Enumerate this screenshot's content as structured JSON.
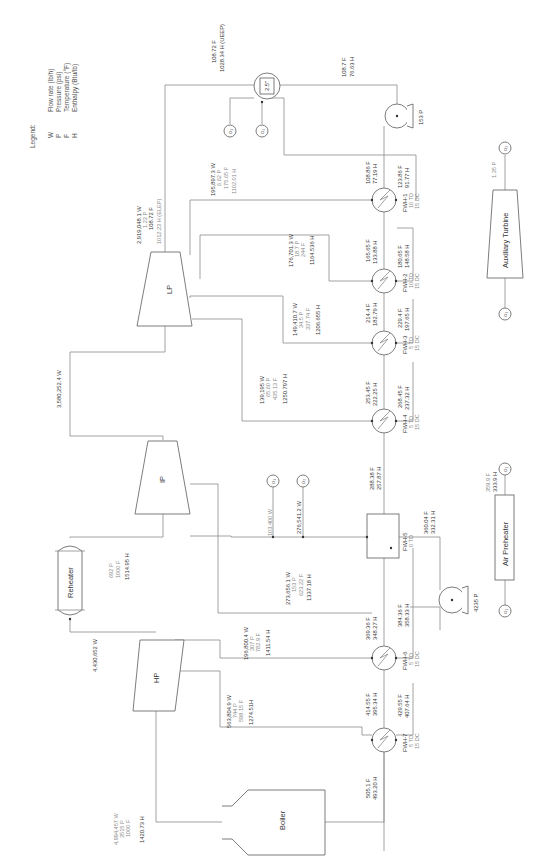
{
  "legend": {
    "title": "Legend:",
    "items": [
      {
        "sym": "W",
        "desc": "Flow rate (lb/h)"
      },
      {
        "sym": "P",
        "desc": "Pressure (psi)"
      },
      {
        "sym": "F",
        "desc": "Temperature (°F)"
      },
      {
        "sym": "H",
        "desc": "Enthalpy (Btu/lb)"
      }
    ]
  },
  "equipment": {
    "boiler": "Boiler",
    "hp": "HP",
    "ip": "IP",
    "lp": "LP",
    "reheater": "Reheater",
    "condenser": "2.5\"",
    "aux_turbine": "Auxiliary Turbine",
    "air_preheater": "Air Preheater",
    "alpha1": "α₁",
    "alpha2": "α₂",
    "alpha4": "α₄"
  },
  "streams": {
    "boiler_out": [
      "4,994,457 W",
      "3515 P",
      "1000 F",
      "1420.73 H"
    ],
    "hp_out": "4,430,652 W",
    "reheat": [
      "692 P",
      "1000 F",
      "1514.95 H"
    ],
    "hp_ext": [
      "563,804.9 W",
      "744 P",
      "598.15 F",
      "1274.51H"
    ],
    "ip_ext1": [
      "196,800.4 W",
      "307 P",
      "782.9 F",
      "1411.54 H"
    ],
    "ip_ext_a1": "103,400 W",
    "ip_ext_a2": "276,541.2 W",
    "ip_exh": [
      "273,656.1 W",
      "153 P",
      "623.22 F",
      "1337.18 H"
    ],
    "ip_to_lp": "3,580,252.4 W",
    "lp_ext4": [
      "139,195 W",
      "65.60 P",
      "435.13 F",
      "1250.797 H"
    ],
    "lp_ext3": [
      "149,410.7 W",
      "34.5 P",
      "337.74 F",
      "1206.655 H"
    ],
    "lp_ext2": [
      "176,701.3 W",
      "18.7 P",
      "244 F",
      "1164.536 H"
    ],
    "lp_ext1": [
      "195,897.3 W",
      "6.62 P",
      "175.65 F",
      "1102.01 H"
    ],
    "lp_exh": [
      "2,919,048.1 W",
      "1.23 P",
      "108.72 F",
      "1012.23 H (ELEP)"
    ],
    "cond_in": [
      "108.72 F",
      "1028.34 H (UEEP)"
    ],
    "cond_out": [
      "108.7 F",
      "76.63 H"
    ],
    "cond_pump": "153 P",
    "fwh1_in": [
      "108.86 F",
      "77.19 H"
    ],
    "fwh1_drain": [
      "123.86 F",
      "91.77 H"
    ],
    "fwh2_in": [
      "165.65 F",
      "133.88 H"
    ],
    "fwh2_drain": [
      "180.65 F",
      "148.58 H"
    ],
    "fwh3_in": [
      "214.4 F",
      "182.79 H"
    ],
    "fwh3_drain": [
      "229.4 F",
      "197.65 H"
    ],
    "fwh4_in": [
      "253.45 F",
      "222.25 H"
    ],
    "fwh4_drain": [
      "268.45 F",
      "237.32 H"
    ],
    "fwh5_in": [
      "288.38 F",
      "257.87 H"
    ],
    "fwh5_out": [
      "360.04 F",
      "332.31 H"
    ],
    "fw_pump": "4235 P",
    "fwh6_in": [
      "369.36 F",
      "348.27 H"
    ],
    "fwh6_drain": [
      "384.36 F",
      "358.33 H"
    ],
    "fwh7_in": [
      "414.55 F",
      "395.34 H"
    ],
    "fwh7_drain": [
      "429.55 F",
      "407.64 H"
    ],
    "boiler_in": [
      "505.1 F",
      "493.20 H"
    ],
    "aux_p": "1.35 P",
    "airph": [
      "359.9 F",
      "333.9 H"
    ]
  },
  "heaters": [
    {
      "name": "FWH-1",
      "td": "10 TD",
      "dc": "15 DC"
    },
    {
      "name": "FWH-2",
      "td": "10 TD",
      "dc": "15 DC"
    },
    {
      "name": "FWH-3",
      "td": "5 TD",
      "dc": "15 DC"
    },
    {
      "name": "FWH-4",
      "td": "5 TD",
      "dc": "15 DC"
    },
    {
      "name": "FWH-5",
      "td": "0 TD",
      "dc": ""
    },
    {
      "name": "FWH-6",
      "td": "5 TD",
      "dc": "15 DC"
    },
    {
      "name": "FWH-7",
      "td": "5 TD",
      "dc": "15 DC"
    }
  ]
}
